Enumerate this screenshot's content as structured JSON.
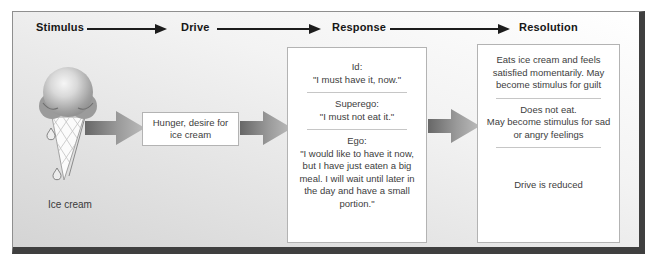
{
  "stages": [
    {
      "label": "Stimulus"
    },
    {
      "label": "Drive"
    },
    {
      "label": "Response"
    },
    {
      "label": "Resolution"
    }
  ],
  "stimulus": {
    "icon": "ice-cream-cone-icon",
    "caption": "Ice cream"
  },
  "drive": {
    "box_text": "Hunger, desire for ice cream"
  },
  "response": {
    "sections": [
      {
        "label": "Id:",
        "quote": "\"I must have it, now.\""
      },
      {
        "label": "Superego:",
        "quote": "\"I must not eat it.\""
      },
      {
        "label": "Ego:",
        "quote": "\"I would like to have it now, but I have just eaten a big meal. I will wait until later in the day and have a small portion.\""
      }
    ]
  },
  "resolution": {
    "outcomes": [
      {
        "text": "Eats ice cream and feels satisfied momentarily. May become stimulus for guilt"
      },
      {
        "line1": "Does not eat.",
        "line2": "May become stimulus for sad or angry feelings"
      },
      {
        "text": "Drive is reduced"
      }
    ]
  },
  "colors": {
    "frame_border": "#8f8f8f",
    "frame_shadow": "#3f3f3f",
    "background_top": "#ffffff",
    "background_bottom": "#d4d4d4",
    "header_arrow": "#1c1c1c",
    "block_arrow_dark": "#676767",
    "block_arrow_light": "#bcbcbc",
    "box_border": "#b3b3b3",
    "divider": "#c6c6c6",
    "text": "#3d3d3d"
  }
}
